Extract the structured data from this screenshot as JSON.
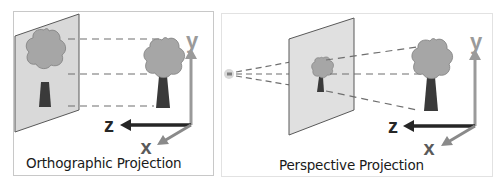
{
  "figure": {
    "panels": [
      {
        "id": "orthographic",
        "caption": "Orthographic Projection",
        "axes": {
          "x": "x",
          "y": "y",
          "z": "z"
        }
      },
      {
        "id": "perspective",
        "caption": "Perspective Projection",
        "axes": {
          "x": "x",
          "y": "y",
          "z": "z"
        }
      }
    ],
    "colors": {
      "plane_fill": "#d9d9d9",
      "plane_stroke": "#595959",
      "canopy_fill": "#a6a6a6",
      "canopy_stroke": "#7f7f7f",
      "trunk_fill": "#3a3a3a",
      "projection_line": "#6f6f6f",
      "axis_y": "#9a9a9a",
      "axis_x": "#8a8a8a",
      "axis_z": "#262626",
      "eye_point": "#cfcfcf"
    }
  }
}
